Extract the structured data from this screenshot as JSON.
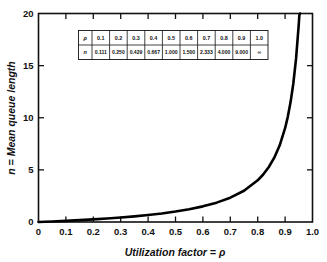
{
  "chart_data": {
    "type": "line",
    "title": "",
    "xlabel": "Utilization factor = ρ",
    "ylabel": "n = Mean queue length",
    "xlim": [
      0,
      1.0
    ],
    "ylim": [
      0,
      20
    ],
    "grid": false,
    "legend": "none",
    "xticklabels": [
      "0",
      "0.1",
      "0.2",
      "0.3",
      "0.4",
      "0.5",
      "0.6",
      "0.7",
      "0.8",
      "0.9",
      "1.0"
    ],
    "xtickvalues": [
      0,
      0.1,
      0.2,
      0.3,
      0.4,
      0.5,
      0.6,
      0.7,
      0.8,
      0.9,
      1.0
    ],
    "yticklabels": [
      "0",
      "5",
      "10",
      "15",
      "20"
    ],
    "ytickvalues": [
      0,
      5,
      10,
      15,
      20
    ],
    "series": [
      {
        "name": "n = ρ/(1-ρ)",
        "x": [
          0,
          0.05,
          0.1,
          0.15,
          0.2,
          0.25,
          0.3,
          0.35,
          0.4,
          0.45,
          0.5,
          0.55,
          0.6,
          0.65,
          0.7,
          0.75,
          0.8,
          0.82,
          0.84,
          0.86,
          0.88,
          0.9,
          0.91,
          0.92,
          0.93,
          0.94,
          0.95,
          0.952
        ],
        "y": [
          0,
          0.053,
          0.111,
          0.176,
          0.25,
          0.333,
          0.429,
          0.538,
          0.667,
          0.818,
          1.0,
          1.222,
          1.5,
          1.857,
          2.333,
          3.0,
          4.0,
          4.556,
          5.25,
          6.143,
          7.333,
          9.0,
          10.111,
          11.5,
          13.286,
          15.667,
          19.0,
          19.833
        ]
      }
    ]
  },
  "inset_table": {
    "row_labels": [
      "ρ",
      "n"
    ],
    "rho_values": [
      "0.1",
      "0.2",
      "0.3",
      "0.4",
      "0.5",
      "0.6",
      "0.7",
      "0.8",
      "0.9",
      "1.0"
    ],
    "n_values": [
      "0.111",
      "0.250",
      "0.429",
      "0.667",
      "1.000",
      "1.500",
      "2.333",
      "4.000",
      "9.000",
      "∞"
    ]
  },
  "colors": {
    "curve": "#000000",
    "axis": "#111111",
    "background": "#ffffff"
  }
}
